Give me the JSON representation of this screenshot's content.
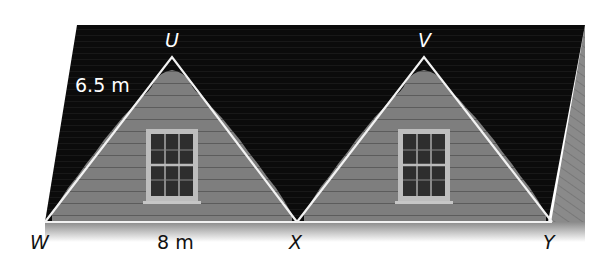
{
  "figure": {
    "colors": {
      "roof": "#0c0c0c",
      "siding": "#7d7d7d",
      "overlay_lines": "#f2f2f2",
      "label_dark": "#111111",
      "label_light": "#ffffff"
    },
    "points": {
      "U": {
        "label": "U",
        "x": 172,
        "y": 57
      },
      "V": {
        "label": "V",
        "x": 424,
        "y": 57
      },
      "W": {
        "label": "W",
        "x": 45,
        "y": 222
      },
      "X": {
        "label": "X",
        "x": 297,
        "y": 222
      },
      "Y": {
        "label": "Y",
        "x": 552,
        "y": 222
      }
    },
    "measurements": {
      "side_WU": "6.5 m",
      "side_WX": "8 m"
    }
  }
}
